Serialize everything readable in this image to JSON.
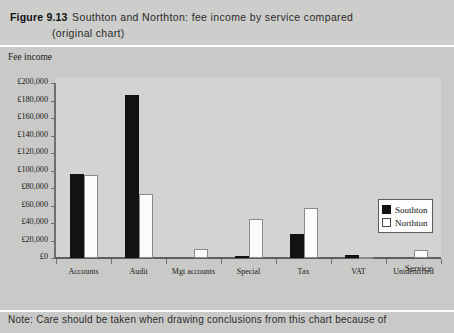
{
  "figure": {
    "label": "Figure 9.13",
    "title_line1": "Southton and Northton: fee income by service compared",
    "title_line2": "(original chart)"
  },
  "note": {
    "text": "Note: Care should be taken when drawing conclusions from this chart because of"
  },
  "colors": {
    "southton": "#121212",
    "northton": "#fbfbfb",
    "plot_background": "#d3d3d1",
    "page_background": "#c9c9c7",
    "axis": "#5e5e5e"
  },
  "legend": {
    "position": "right-inside",
    "entries": [
      {
        "label": "Southton",
        "swatch": "black-filled-square"
      },
      {
        "label": "Northton",
        "swatch": "white-outlined-square"
      }
    ]
  },
  "chart_data": {
    "type": "bar",
    "title": "Southton and Northton: fee income by service compared (original chart)",
    "xlabel": "Service",
    "ylabel": "Fee income",
    "ylim": [
      0,
      200000
    ],
    "ytick_step": 20000,
    "ytick_labels": [
      "£200,000",
      "£180,000",
      "£160,000",
      "£140,000",
      "£120,000",
      "£100,000",
      "£80,000",
      "£60,000",
      "£40,000",
      "£20,000",
      "£0"
    ],
    "ytick_values": [
      200000,
      180000,
      160000,
      140000,
      120000,
      100000,
      80000,
      60000,
      40000,
      20000,
      0
    ],
    "grid": false,
    "categories": [
      "Accounts",
      "Audit",
      "Mgt accounts",
      "Special",
      "Tax",
      "VAT",
      "Unidentified"
    ],
    "series": [
      {
        "name": "Southton",
        "values": [
          96000,
          186000,
          0,
          2000,
          28000,
          4000,
          0
        ]
      },
      {
        "name": "Northton",
        "values": [
          95000,
          73000,
          10000,
          45000,
          57000,
          1000,
          9000
        ]
      }
    ]
  }
}
